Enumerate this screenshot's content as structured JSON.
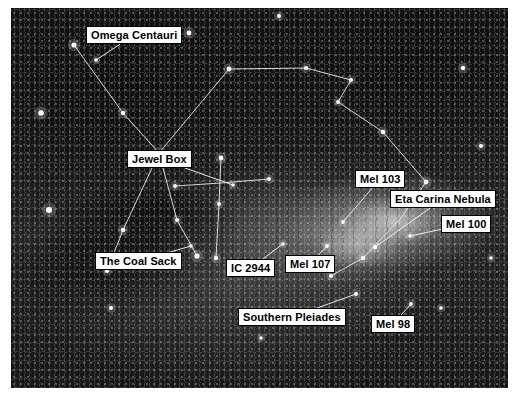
{
  "image": {
    "kind": "astrophotograph",
    "subject": "Southern Milky Way wide-field: Crux, Carina and Centaurus",
    "plate": {
      "x": 11,
      "y": 8,
      "width": 497,
      "height": 380
    },
    "background_color": "#1b1b1b",
    "star_color": "#ffffff",
    "line_color": "#e8e8e8",
    "label_text_color": "#000000",
    "label_background_color": "#ffffff",
    "label_border_color": "#000000"
  },
  "caption": {
    "text": ""
  },
  "labels": [
    {
      "id": "omega-centauri",
      "text": "Omega Centauri",
      "x": 86,
      "y": 26,
      "anchor_x": 85,
      "anchor_y": 52
    },
    {
      "id": "jewel-box",
      "text": "Jewel Box",
      "x": 127,
      "y": 150,
      "anchor_x": 222,
      "anchor_y": 177
    },
    {
      "id": "mel-103",
      "text": "Mel 103",
      "x": 355,
      "y": 170,
      "anchor_x": 332,
      "anchor_y": 214
    },
    {
      "id": "eta-carina-nebula",
      "text": "Eta Carina Nebula",
      "x": 390,
      "y": 190,
      "anchor_x": 364,
      "anchor_y": 239
    },
    {
      "id": "mel-100",
      "text": "Mel 100",
      "x": 441,
      "y": 215,
      "anchor_x": 399,
      "anchor_y": 228
    },
    {
      "id": "the-coal-sack",
      "text": "The Coal Sack",
      "x": 95,
      "y": 252,
      "anchor_x": 180,
      "anchor_y": 238
    },
    {
      "id": "ic-2944",
      "text": "IC 2944",
      "x": 226,
      "y": 259,
      "anchor_x": 272,
      "anchor_y": 236
    },
    {
      "id": "mel-107",
      "text": "Mel 107",
      "x": 285,
      "y": 255,
      "anchor_x": 316,
      "anchor_y": 238
    },
    {
      "id": "southern-pleiades",
      "text": "Southern Pleiades",
      "x": 238,
      "y": 308,
      "anchor_x": 345,
      "anchor_y": 286
    },
    {
      "id": "mel-98",
      "text": "Mel 98",
      "x": 371,
      "y": 315,
      "anchor_x": 400,
      "anchor_y": 296
    }
  ],
  "constellation_lines": {
    "note": "Polyline vertex chains drawn over the star field, in plate-local coordinates",
    "chains": [
      {
        "id": "centaurus-upper",
        "points": "63,37 112,105 148,145 218,61 295,60 340,72 327,94 372,124 415,174"
      },
      {
        "id": "centaurus-lower",
        "points": "148,145 112,222 96,263"
      },
      {
        "id": "centaurus-leg",
        "points": "148,145 166,212 186,248"
      },
      {
        "id": "crux-vertical",
        "points": "210,150 208,196 205,250"
      },
      {
        "id": "crux-horizontal",
        "points": "164,178 210,175 258,171"
      },
      {
        "id": "carina-arc",
        "points": "415,174 390,210 352,250 320,268"
      }
    ]
  },
  "stars": {
    "note": "Bright star positions in plate-local coordinates with radius in px",
    "points": [
      [
        63,
        37,
        2.6
      ],
      [
        112,
        105,
        2.2
      ],
      [
        148,
        145,
        2.6
      ],
      [
        218,
        61,
        2.4
      ],
      [
        295,
        60,
        2.1
      ],
      [
        340,
        72,
        2.0
      ],
      [
        327,
        94,
        1.9
      ],
      [
        372,
        124,
        2.2
      ],
      [
        415,
        174,
        2.4
      ],
      [
        112,
        222,
        2.3
      ],
      [
        96,
        263,
        2.0
      ],
      [
        166,
        212,
        2.0
      ],
      [
        186,
        248,
        2.6
      ],
      [
        210,
        150,
        2.4
      ],
      [
        208,
        196,
        2.0
      ],
      [
        205,
        250,
        2.2
      ],
      [
        164,
        178,
        2.0
      ],
      [
        258,
        171,
        2.0
      ],
      [
        352,
        250,
        2.2
      ],
      [
        320,
        268,
        2.0
      ],
      [
        30,
        105,
        2.8
      ],
      [
        178,
        25,
        2.4
      ],
      [
        38,
        202,
        3.0
      ],
      [
        452,
        60,
        2.2
      ],
      [
        470,
        138,
        2.0
      ],
      [
        268,
        8,
        2.0
      ],
      [
        100,
        300,
        2.0
      ],
      [
        250,
        330,
        1.8
      ],
      [
        430,
        300,
        1.8
      ],
      [
        480,
        250,
        1.8
      ],
      [
        345,
        286,
        2.0
      ],
      [
        400,
        296,
        1.9
      ],
      [
        272,
        236,
        1.8
      ],
      [
        316,
        238,
        1.9
      ],
      [
        180,
        238,
        1.7
      ],
      [
        364,
        239,
        2.2
      ],
      [
        399,
        228,
        1.8
      ],
      [
        332,
        214,
        1.9
      ],
      [
        222,
        177,
        1.8
      ],
      [
        85,
        52,
        1.8
      ]
    ]
  }
}
